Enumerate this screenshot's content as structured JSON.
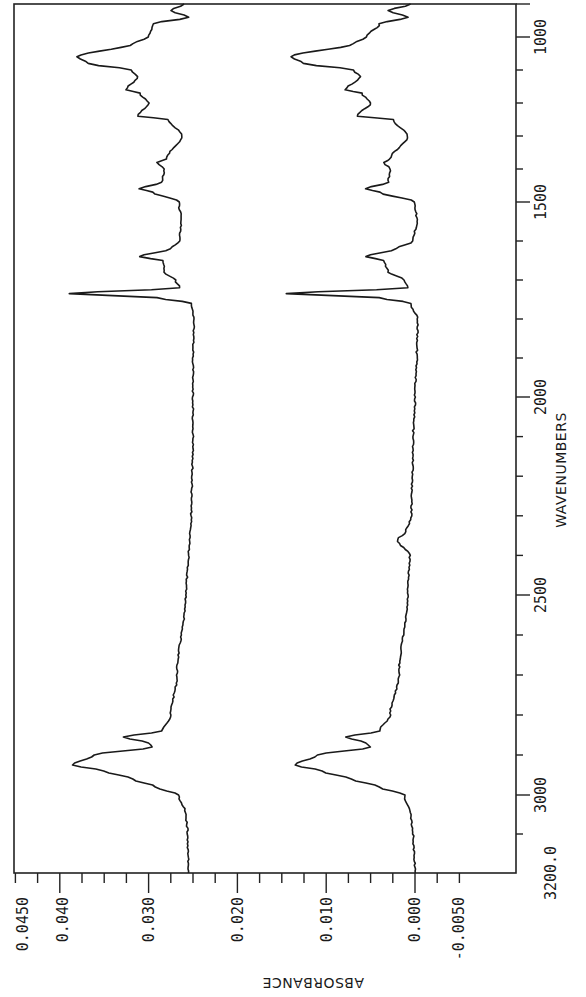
{
  "chart_data": {
    "type": "line",
    "title": "",
    "orientation": "rotated 90deg clockwise (wavenumber axis vertical on right, absorbance axis horizontal at bottom, text reads sideways)",
    "xlabel": "WAVENUMBERS",
    "ylabel": "ABSORBANCE",
    "x_axis": {
      "label": "WAVENUMBERS",
      "range": [
        900,
        3200
      ],
      "tick_labels": [
        "1000",
        "1500",
        "2000",
        "2500",
        "3000",
        "3200.0"
      ],
      "ticks": [
        1000,
        1500,
        2000,
        2500,
        3000,
        3200
      ]
    },
    "y_axis": {
      "label": "ABSORBANCE",
      "range": [
        -0.005,
        0.045
      ],
      "tick_labels": [
        "0.0450",
        "0.040",
        "0.030",
        "0.020",
        "0.010",
        "0.000",
        "-0.0050"
      ],
      "ticks": [
        0.045,
        0.04,
        0.03,
        0.02,
        0.01,
        0.0,
        -0.005
      ]
    },
    "grid": false,
    "legend": null,
    "series": [
      {
        "name": "Upper spectrum (offset)",
        "x": [
          3200,
          3100,
          3050,
          3000,
          2980,
          2960,
          2940,
          2925,
          2900,
          2880,
          2870,
          2855,
          2840,
          2800,
          2700,
          2500,
          2400,
          2360,
          2300,
          2100,
          2000,
          1900,
          1800,
          1760,
          1745,
          1735,
          1720,
          1700,
          1680,
          1650,
          1640,
          1620,
          1600,
          1550,
          1500,
          1470,
          1460,
          1440,
          1400,
          1380,
          1370,
          1300,
          1250,
          1240,
          1200,
          1170,
          1160,
          1120,
          1100,
          1080,
          1060,
          1020,
          1000,
          960,
          940,
          920,
          900
        ],
        "y": [
          0.0255,
          0.0256,
          0.0258,
          0.0266,
          0.0292,
          0.0318,
          0.035,
          0.0385,
          0.0362,
          0.0296,
          0.03,
          0.0328,
          0.0285,
          0.0275,
          0.0268,
          0.0258,
          0.0255,
          0.0254,
          0.0252,
          0.025,
          0.025,
          0.025,
          0.0249,
          0.0252,
          0.029,
          0.039,
          0.0265,
          0.027,
          0.0282,
          0.0284,
          0.031,
          0.0275,
          0.0265,
          0.0263,
          0.0266,
          0.0295,
          0.031,
          0.0285,
          0.0282,
          0.029,
          0.028,
          0.0262,
          0.0278,
          0.0312,
          0.03,
          0.031,
          0.0325,
          0.0312,
          0.032,
          0.0368,
          0.038,
          0.0318,
          0.03,
          0.0295,
          0.0255,
          0.0275,
          0.026
        ]
      },
      {
        "name": "Lower spectrum",
        "x": [
          3200,
          3100,
          3050,
          3000,
          2980,
          2960,
          2940,
          2925,
          2900,
          2880,
          2870,
          2855,
          2840,
          2800,
          2700,
          2500,
          2400,
          2360,
          2340,
          2300,
          2100,
          2000,
          1900,
          1800,
          1760,
          1745,
          1735,
          1720,
          1700,
          1680,
          1650,
          1640,
          1620,
          1600,
          1550,
          1500,
          1470,
          1460,
          1440,
          1400,
          1380,
          1370,
          1300,
          1250,
          1240,
          1200,
          1170,
          1160,
          1120,
          1100,
          1080,
          1060,
          1020,
          1000,
          960,
          940,
          920,
          900
        ],
        "y": [
          0.0,
          0.0002,
          0.0005,
          0.0012,
          0.004,
          0.0072,
          0.0105,
          0.0135,
          0.011,
          0.005,
          0.0055,
          0.0078,
          0.004,
          0.0028,
          0.0018,
          0.0008,
          0.0006,
          0.002,
          0.001,
          0.0004,
          0.0002,
          0.0,
          -0.0002,
          -0.0003,
          0.0005,
          0.004,
          0.0145,
          0.0008,
          0.0012,
          0.003,
          0.0035,
          0.0055,
          0.0022,
          0.0002,
          -0.0002,
          0.0,
          0.004,
          0.0055,
          0.003,
          0.0028,
          0.0035,
          0.0028,
          0.0008,
          0.0025,
          0.0065,
          0.005,
          0.006,
          0.0078,
          0.0062,
          0.007,
          0.0125,
          0.014,
          0.007,
          0.0055,
          0.004,
          0.0008,
          0.003,
          0.0005
        ]
      }
    ]
  },
  "axes": {
    "wavenumber_label": "WAVENUMBERS",
    "absorbance_label": "ABSORBANCE",
    "wavenumber_ticks": [
      {
        "label": "1000",
        "y": 37
      },
      {
        "label": "1500",
        "y": 202
      },
      {
        "label": "2000",
        "y": 397
      },
      {
        "label": "2500",
        "y": 595
      },
      {
        "label": "3000",
        "y": 795
      },
      {
        "label": "3200.0",
        "y": 873
      }
    ],
    "absorbance_ticks": [
      {
        "label": "0.0450",
        "x": 23
      },
      {
        "label": "0.040",
        "x": 63
      },
      {
        "label": "0.030",
        "x": 149
      },
      {
        "label": "0.020",
        "x": 238
      },
      {
        "label": "0.010",
        "x": 327
      },
      {
        "label": "0.000",
        "x": 415
      },
      {
        "label": "-0.0050",
        "x": 459
      }
    ]
  }
}
